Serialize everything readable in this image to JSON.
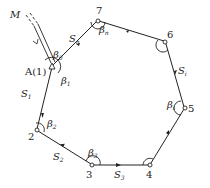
{
  "colors": {
    "line": "#222222",
    "background": "#ffffff"
  },
  "external_point": {
    "label": "M"
  },
  "start_point": {
    "label": "A(1)",
    "angle0": "β",
    "angle0_sub": "0",
    "angle1": "β",
    "angle1_sub": "1"
  },
  "stations": [
    {
      "id": "1",
      "label": "A(1)"
    },
    {
      "id": "2",
      "label": "2",
      "angle": "β",
      "angle_sub": "2"
    },
    {
      "id": "3",
      "label": "3",
      "angle": "β",
      "angle_sub": "3"
    },
    {
      "id": "4",
      "label": "4"
    },
    {
      "id": "5",
      "label": "5",
      "angle": "β",
      "angle_sub": "i"
    },
    {
      "id": "6",
      "label": "6"
    },
    {
      "id": "7",
      "label": "7",
      "angle": "β",
      "angle_sub": "n"
    }
  ],
  "sides": [
    {
      "label": "S",
      "sub": "1"
    },
    {
      "label": "S",
      "sub": "2"
    },
    {
      "label": "S",
      "sub": "3"
    },
    {
      "label": "S",
      "sub": "i"
    },
    {
      "label": "S",
      "sub": "n"
    }
  ]
}
